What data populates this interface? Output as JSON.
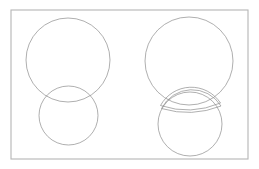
{
  "figure": {
    "canvas": {
      "width": 259,
      "height": 169,
      "background": "#ffffff"
    },
    "colors": {
      "stroke": "#8c8c8c",
      "frame": "#b5b5b5",
      "background": "#ffffff",
      "fill": "none"
    },
    "frame": {
      "name": "outer-border",
      "x": 11,
      "y": 10,
      "width": 237,
      "height": 149,
      "stroke_width": 1.1
    },
    "panels": [
      {
        "id": "left",
        "name": "overlapping-circles-panel",
        "label": "Overlapping circles",
        "shapes": [
          {
            "id": "left-large-circle",
            "name": "large-circle",
            "type": "circle",
            "cx": 68,
            "cy": 60,
            "r": 42
          },
          {
            "id": "left-small-circle",
            "name": "small-circle",
            "type": "circle",
            "cx": 68.5,
            "cy": 115.5,
            "r": 29.5
          }
        ]
      },
      {
        "id": "right",
        "name": "separated-lens-panel",
        "label": "Separated intersection",
        "shapes": [
          {
            "id": "right-large-circle",
            "name": "large-circle",
            "type": "circle",
            "cx": 189,
            "cy": 61,
            "r": 44
          },
          {
            "id": "right-small-circle",
            "name": "small-circle",
            "type": "circle",
            "cx": 190,
            "cy": 124,
            "r": 32
          },
          {
            "id": "right-lens-upper",
            "name": "lens-intersection-region",
            "type": "lens",
            "left_point": [
              160.5,
              105.5
            ],
            "right_point": [
              220.5,
              103.0
            ],
            "top_sagitta": 17.0,
            "bottom_sagitta": 5.5
          },
          {
            "id": "right-lens-lower",
            "name": "lens-intersection-outline-offset",
            "type": "lens",
            "left_point": [
              161.5,
              108.5
            ],
            "right_point": [
              221.0,
              106.0
            ],
            "top_sagitta": 17.5,
            "bottom_sagitta": 5.0
          }
        ]
      }
    ]
  }
}
